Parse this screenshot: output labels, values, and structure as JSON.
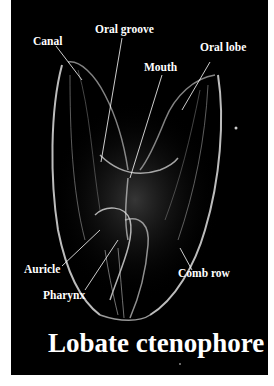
{
  "figure": {
    "title": "Lobate ctenophore",
    "background": "#000000",
    "label_color": "#ffffff",
    "labels": [
      {
        "id": "canal",
        "text": "Canal"
      },
      {
        "id": "oral-groove",
        "text": "Oral groove"
      },
      {
        "id": "oral-lobe",
        "text": "Oral lobe"
      },
      {
        "id": "mouth",
        "text": "Mouth"
      },
      {
        "id": "auricle",
        "text": "Auricle"
      },
      {
        "id": "comb-row",
        "text": "Comb row"
      },
      {
        "id": "pharynx",
        "text": "Pharynx"
      }
    ]
  }
}
